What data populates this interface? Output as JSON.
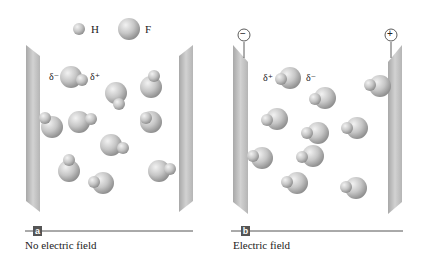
{
  "legend": {
    "h_label": "H",
    "f_label": "F"
  },
  "panel_a": {
    "tag": "a",
    "caption": "No electric field",
    "delta_left": "δ⁻",
    "delta_right": "δ⁺"
  },
  "panel_b": {
    "tag": "b",
    "caption": "Electric field",
    "delta_left": "δ⁺",
    "delta_right": "δ⁻",
    "left_terminal": "−",
    "right_terminal": "+"
  },
  "colors": {
    "plate": "#bdbdbd",
    "atom": "#c8c8c8",
    "rule": "#555555"
  }
}
